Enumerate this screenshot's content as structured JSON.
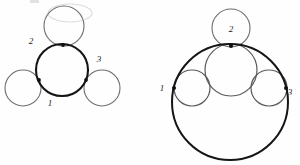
{
  "canvas": {
    "width": 300,
    "height": 165,
    "background": "#fefefe",
    "stroke_dark": "#141414",
    "stroke_mid": "#4a4a4a",
    "stroke_light": "#8c8c8c",
    "artifact_color": "#d8d8d8"
  },
  "figure_left": {
    "name": "tangent-circles-chain",
    "labels": {
      "one": "1",
      "two": "2",
      "three": "3"
    },
    "label_positions": {
      "one": {
        "x": 50,
        "y": 106
      },
      "two": {
        "x": 31,
        "y": 44
      },
      "three": {
        "x": 99,
        "y": 62
      }
    },
    "circles": [
      {
        "id": "left-top-satellite",
        "cx": 64,
        "cy": 26,
        "r": 20,
        "weight": "light"
      },
      {
        "id": "left-center-main",
        "cx": 62,
        "cy": 70,
        "r": 26,
        "weight": "dark"
      },
      {
        "id": "left-lower-left-satellite",
        "cx": 23,
        "cy": 88,
        "r": 18,
        "weight": "light"
      },
      {
        "id": "left-lower-right-satellite",
        "cx": 102,
        "cy": 88,
        "r": 18,
        "weight": "light"
      }
    ],
    "tangency_points": [
      {
        "id": "left-tangency-top",
        "x": 63,
        "y": 45
      },
      {
        "id": "left-tangency-lower-left",
        "x": 39,
        "y": 80
      },
      {
        "id": "left-tangency-lower-right",
        "x": 86,
        "y": 80
      }
    ]
  },
  "figure_right": {
    "name": "inscribed-tangent-circles",
    "labels": {
      "one": "1",
      "two": "2",
      "three": "3"
    },
    "label_positions": {
      "one": {
        "x": 162,
        "y": 91
      },
      "two": {
        "x": 231,
        "y": 32
      },
      "three": {
        "x": 290,
        "y": 95
      }
    },
    "circles": [
      {
        "id": "right-outer-enclosing",
        "cx": 230,
        "cy": 102,
        "r": 58,
        "weight": "dark"
      },
      {
        "id": "right-top-satellite",
        "cx": 231,
        "cy": 28,
        "r": 19,
        "weight": "light"
      },
      {
        "id": "right-center-inner",
        "cx": 231,
        "cy": 70,
        "r": 26,
        "weight": "mid"
      },
      {
        "id": "right-left-inner",
        "cx": 192,
        "cy": 88,
        "r": 18,
        "weight": "mid"
      },
      {
        "id": "right-right-inner",
        "cx": 269,
        "cy": 88,
        "r": 18,
        "weight": "mid"
      }
    ],
    "tangency_points": [
      {
        "id": "right-tangency-top",
        "x": 231,
        "y": 46
      },
      {
        "id": "right-tangency-left",
        "x": 174,
        "y": 88
      },
      {
        "id": "right-tangency-right",
        "x": 286,
        "y": 88
      }
    ]
  },
  "artifacts": [
    {
      "id": "top-faint-arc",
      "cx": 70,
      "cy": 11,
      "rx": 22,
      "ry": 8
    }
  ]
}
